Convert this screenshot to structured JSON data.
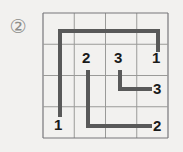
{
  "problem": {
    "number_label": "②",
    "number": "2"
  },
  "colors": {
    "background": "#f2f1ef",
    "grid_line": "#9a9a98",
    "grid_border": "#77777a",
    "path_line": "#595959",
    "label_text": "#1a1a1a",
    "problem_number": "#8d8d8b"
  },
  "grid": {
    "columns": 4,
    "rows": 4,
    "cell_size": 31.25,
    "origin_x": 43,
    "origin_y": 13,
    "width": 125,
    "height": 125
  },
  "chart_data": {
    "type": "diagram",
    "title": "",
    "grid_size": [
      4,
      4
    ],
    "endpoints": [
      {
        "number": "1",
        "col": 0,
        "row": 3,
        "x": 60,
        "y": 125
      },
      {
        "number": "1",
        "col": 3,
        "row": 1,
        "x": 158,
        "y": 58
      },
      {
        "number": "2",
        "col": 1,
        "row": 1,
        "x": 88,
        "y": 58
      },
      {
        "number": "2",
        "col": 3,
        "row": 3,
        "x": 159,
        "y": 126
      },
      {
        "number": "3",
        "col": 2,
        "row": 1,
        "x": 120,
        "y": 58
      },
      {
        "number": "3",
        "col": 3,
        "row": 2,
        "x": 159,
        "y": 89
      }
    ],
    "paths": [
      {
        "number": "1",
        "points": [
          [
            60,
            117
          ],
          [
            60,
            31
          ],
          [
            158,
            31
          ],
          [
            158,
            52
          ]
        ]
      },
      {
        "number": "2",
        "points": [
          [
            88,
            70
          ],
          [
            88,
            126
          ],
          [
            152,
            126
          ]
        ]
      },
      {
        "number": "3",
        "points": [
          [
            120,
            70
          ],
          [
            120,
            89
          ],
          [
            152,
            89
          ]
        ]
      }
    ]
  },
  "labels": [
    {
      "name": "endpoint-label-1-bottom-left",
      "text": "1",
      "left": 54,
      "top": 117
    },
    {
      "name": "endpoint-label-1-top-right",
      "text": "1",
      "left": 152,
      "top": 50
    },
    {
      "name": "endpoint-label-2-top",
      "text": "2",
      "left": 82,
      "top": 50
    },
    {
      "name": "endpoint-label-2-bottom-right",
      "text": "2",
      "left": 153,
      "top": 118
    },
    {
      "name": "endpoint-label-3-top",
      "text": "3",
      "left": 114,
      "top": 50
    },
    {
      "name": "endpoint-label-3-right",
      "text": "3",
      "left": 153,
      "top": 81
    }
  ]
}
